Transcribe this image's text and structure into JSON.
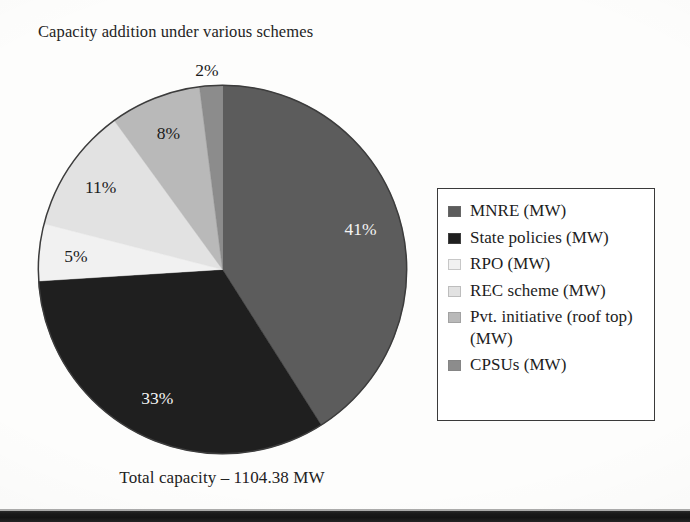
{
  "chart_data": {
    "type": "pie",
    "title": "Capacity addition under various schemes",
    "subtitle": "",
    "xlabel": "",
    "ylabel": "",
    "caption": "Total capacity – 1104.38 MW",
    "total_label": "Total capacity – 1104.38 MW",
    "total_value": 1104.38,
    "total_units": "MW",
    "legend_position": "right",
    "grid": false,
    "start_angle_deg": 0,
    "direction": "clockwise",
    "categories": [
      "MNRE (MW)",
      "State policies (MW)",
      "RPO (MW)",
      "REC scheme (MW)",
      "Pvt. initiative (roof top) (MW)",
      "CPSUs (MW)"
    ],
    "values": [
      41,
      33,
      5,
      11,
      8,
      2
    ],
    "value_labels": [
      "41%",
      "33%",
      "5%",
      "11%",
      "8%",
      "2%"
    ],
    "colors": [
      "#5c5c5c",
      "#1f1f1f",
      "#f1f1f1",
      "#e2e2e2",
      "#b9b9b9",
      "#8c8c8c"
    ],
    "slices": [
      {
        "name": "MNRE (MW)",
        "percent": 41,
        "label": "41%",
        "color": "#5c5c5c",
        "label_color": "light"
      },
      {
        "name": "State policies (MW)",
        "percent": 33,
        "label": "33%",
        "color": "#1f1f1f",
        "label_color": "light"
      },
      {
        "name": "RPO (MW)",
        "percent": 5,
        "label": "5%",
        "color": "#f1f1f1",
        "label_color": "dark"
      },
      {
        "name": "REC scheme (MW)",
        "percent": 11,
        "label": "11%",
        "color": "#e2e2e2",
        "label_color": "dark"
      },
      {
        "name": "Pvt. initiative (roof top) (MW)",
        "percent": 8,
        "label": "8%",
        "color": "#b9b9b9",
        "label_color": "dark"
      },
      {
        "name": "CPSUs (MW)",
        "percent": 2,
        "label": "2%",
        "color": "#8c8c8c",
        "label_color": "dark"
      }
    ]
  },
  "title": {
    "text": "Capacity addition under various schemes"
  },
  "legend": {
    "items": [
      {
        "label": "MNRE (MW)",
        "color": "#5c5c5c"
      },
      {
        "label": "State policies (MW)",
        "color": "#1f1f1f"
      },
      {
        "label": "RPO (MW)",
        "color": "#f1f1f1"
      },
      {
        "label": "REC scheme (MW)",
        "color": "#e2e2e2"
      },
      {
        "label": "Pvt. initiative (roof top) (MW)",
        "color": "#b9b9b9"
      },
      {
        "label": "CPSUs (MW)",
        "color": "#8c8c8c"
      }
    ]
  },
  "footer": {
    "total": "Total capacity – 1104.38 MW"
  },
  "pie_labels": {
    "mnre": "41%",
    "state_policies": "33%",
    "rpo": "5%",
    "rec_scheme": "11%",
    "pvt_initiative": "8%",
    "cpsus": "2%"
  }
}
